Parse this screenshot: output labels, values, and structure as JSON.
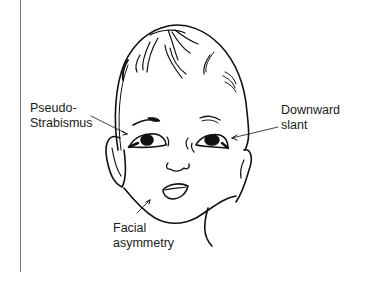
{
  "figure": {
    "labels": [
      {
        "id": "pseudo-strabismus",
        "lines": [
          "Pseudo-",
          "Strabismus"
        ]
      },
      {
        "id": "downward-slant",
        "lines": [
          "Downward",
          "slant"
        ]
      },
      {
        "id": "facial-asymmetry",
        "lines": [
          "Facial",
          "asymmetry"
        ]
      }
    ]
  },
  "colors": {
    "ink": "#111111",
    "label_text": "#1a1a1a",
    "frame_line": "#7a7a7a",
    "background": "#ffffff"
  }
}
